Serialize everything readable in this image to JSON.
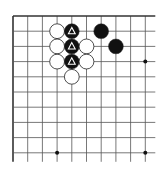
{
  "board": {
    "description": "Go board corner diagram (top-left), 10 visible columns x 10 visible rows, open on right and bottom",
    "colors": {
      "background": "#ffffff",
      "line": "#555555",
      "edge": "#333333",
      "black": "#111111",
      "white": "#ffffff",
      "marker_on_black": "#ffffff"
    },
    "origin": {
      "x": 13,
      "y": 16
    },
    "spacing": {
      "x": 14.7,
      "y": 15.2
    },
    "cols": 10,
    "rows": 10,
    "star_points": [
      {
        "col": 9,
        "row": 3
      },
      {
        "col": 3,
        "row": 9
      },
      {
        "col": 9,
        "row": 9
      }
    ],
    "stones": [
      {
        "color": "white",
        "col": 3,
        "row": 1,
        "marker": ""
      },
      {
        "color": "black",
        "col": 4,
        "row": 1,
        "marker": "triangle"
      },
      {
        "color": "black",
        "col": 6,
        "row": 1,
        "marker": ""
      },
      {
        "color": "white",
        "col": 3,
        "row": 2,
        "marker": ""
      },
      {
        "color": "black",
        "col": 4,
        "row": 2,
        "marker": "triangle"
      },
      {
        "color": "white",
        "col": 5,
        "row": 2,
        "marker": ""
      },
      {
        "color": "black",
        "col": 7,
        "row": 2,
        "marker": ""
      },
      {
        "color": "white",
        "col": 3,
        "row": 3,
        "marker": ""
      },
      {
        "color": "black",
        "col": 4,
        "row": 3,
        "marker": "triangle"
      },
      {
        "color": "white",
        "col": 5,
        "row": 3,
        "marker": ""
      },
      {
        "color": "white",
        "col": 4,
        "row": 4,
        "marker": ""
      }
    ]
  }
}
